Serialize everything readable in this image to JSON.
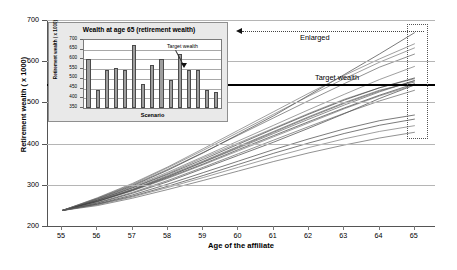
{
  "chart_data": {
    "type": "line",
    "title": "",
    "xlabel": "Age of the affiliate",
    "ylabel": "Retirement wealth ( x 1000)",
    "xlim": [
      54.6,
      65.6
    ],
    "ylim": [
      200,
      700
    ],
    "xticks": [
      55,
      56,
      57,
      58,
      59,
      60,
      61,
      62,
      63,
      64,
      65
    ],
    "yticks": [
      200,
      300,
      400,
      500,
      600,
      700
    ],
    "grid": true,
    "legend": "none",
    "annotations": [
      {
        "name": "target-wealth",
        "label": "Target wealth",
        "y": 545,
        "style": "thick black horizontal line"
      },
      {
        "name": "enlarged",
        "label": "Enlarged",
        "style": "dotted arrow pointing left to inset"
      },
      {
        "name": "highlight-box",
        "label": "",
        "style": "dotted rectangle at age 65 spanning 430-675"
      }
    ],
    "x": [
      55,
      56,
      57,
      58,
      59,
      60,
      61,
      62,
      63,
      64,
      65
    ],
    "series": [
      {
        "name": "scenario 1",
        "values": [
          240,
          268,
          300,
          338,
          380,
          425,
          470,
          520,
          570,
          620,
          672
        ]
      },
      {
        "name": "scenario 2",
        "values": [
          240,
          262,
          290,
          322,
          358,
          394,
          430,
          466,
          500,
          530,
          555
        ]
      },
      {
        "name": "scenario 3",
        "values": [
          240,
          266,
          296,
          330,
          368,
          404,
          440,
          476,
          510,
          538,
          560
        ]
      },
      {
        "name": "scenario 4",
        "values": [
          240,
          258,
          282,
          310,
          342,
          374,
          406,
          440,
          475,
          512,
          545
        ]
      },
      {
        "name": "scenario 5",
        "values": [
          240,
          264,
          292,
          325,
          360,
          396,
          432,
          468,
          502,
          532,
          552
        ]
      },
      {
        "name": "scenario 6",
        "values": [
          240,
          270,
          304,
          344,
          386,
          430,
          474,
          518,
          560,
          600,
          635
        ]
      },
      {
        "name": "scenario 7",
        "values": [
          240,
          256,
          278,
          304,
          332,
          360,
          388,
          414,
          438,
          458,
          472
        ]
      },
      {
        "name": "scenario 8",
        "values": [
          240,
          263,
          291,
          323,
          357,
          392,
          427,
          462,
          496,
          528,
          556
        ]
      },
      {
        "name": "scenario 9",
        "values": [
          240,
          267,
          298,
          333,
          371,
          409,
          447,
          485,
          522,
          558,
          590
        ]
      },
      {
        "name": "scenario 10",
        "values": [
          240,
          255,
          275,
          299,
          325,
          352,
          379,
          404,
          427,
          447,
          462
        ]
      },
      {
        "name": "scenario 11",
        "values": [
          240,
          269,
          302,
          340,
          381,
          423,
          465,
          507,
          548,
          588,
          620
        ]
      },
      {
        "name": "scenario 12",
        "values": [
          240,
          261,
          288,
          318,
          351,
          385,
          419,
          453,
          487,
          518,
          545
        ]
      },
      {
        "name": "scenario 13",
        "values": [
          240,
          262,
          289,
          320,
          353,
          388,
          422,
          456,
          489,
          520,
          548
        ]
      },
      {
        "name": "scenario 14",
        "values": [
          240,
          252,
          270,
          291,
          313,
          336,
          359,
          380,
          399,
          416,
          430
        ]
      },
      {
        "name": "scenario 15",
        "values": [
          240,
          254,
          273,
          296,
          320,
          345,
          370,
          393,
          414,
          432,
          446
        ]
      },
      {
        "name": "scenario 16",
        "values": [
          240,
          265,
          295,
          328,
          364,
          401,
          438,
          474,
          508,
          538,
          562
        ]
      },
      {
        "name": "scenario 17",
        "values": [
          240,
          259,
          284,
          313,
          345,
          378,
          411,
          444,
          476,
          506,
          532
        ]
      },
      {
        "name": "scenario 18",
        "values": [
          240,
          271,
          306,
          346,
          390,
          435,
          480,
          525,
          568,
          608,
          645
        ]
      }
    ]
  },
  "inset_chart": {
    "type": "bar",
    "title": "Wealth at age 65 (retirement wealth)",
    "xlabel": "Scenario",
    "ylabel": "Retirement wealth ( x 1000)",
    "ylim": [
      350,
      700
    ],
    "yticks": [
      350,
      400,
      450,
      500,
      550,
      600,
      650,
      700
    ],
    "grid": true,
    "annotation_label": "Target wealth",
    "annotation_value": 545,
    "categories": [
      "1",
      "2",
      "3",
      "4",
      "5",
      "6",
      "7",
      "8",
      "9",
      "10",
      "11",
      "12",
      "13",
      "14",
      "15"
    ],
    "values": [
      600,
      442,
      545,
      556,
      545,
      672,
      472,
      570,
      602,
      492,
      630,
      545,
      548,
      445,
      430
    ]
  },
  "axes": {
    "main_y_title": "Retirement wealth ( x 1000)",
    "main_x_title": "Age of the affiliate",
    "target_label": "Target wealth",
    "enlarged_label": "Enlarged"
  }
}
